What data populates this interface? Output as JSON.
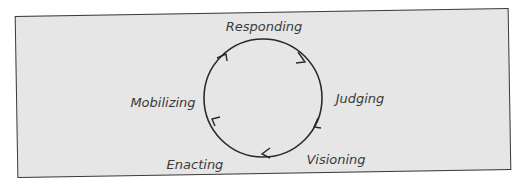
{
  "diagram": {
    "type": "cycle",
    "stages": [
      {
        "label": "Responding",
        "x": 264,
        "y": 31
      },
      {
        "label": "Judging",
        "x": 360,
        "y": 103
      },
      {
        "label": "Visioning",
        "x": 336,
        "y": 164
      },
      {
        "label": "Enacting",
        "x": 195,
        "y": 169
      },
      {
        "label": "Mobilizing",
        "x": 163,
        "y": 107
      }
    ],
    "flow_direction": "clockwise",
    "colors": {
      "background": "#e6e6e6",
      "stroke": "#2a2a2a",
      "text": "#3a3a3a"
    }
  }
}
